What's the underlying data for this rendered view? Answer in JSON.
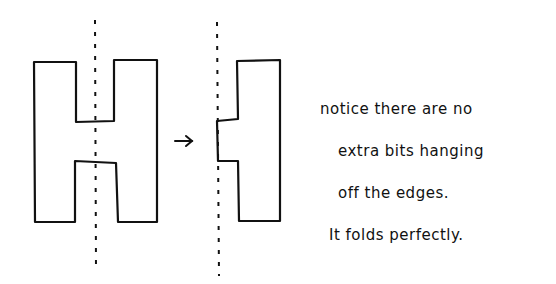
{
  "diagram": {
    "left_shape": "H-shape with dashed vertical fold line through center",
    "arrow": "→",
    "right_shape": "half H folded along dashed line"
  },
  "notes": [
    "notice there are no",
    "extra bits hanging",
    "off the edges.",
    "It folds perfectly."
  ],
  "colors": {
    "ink": "#111111",
    "background": "#ffffff"
  }
}
